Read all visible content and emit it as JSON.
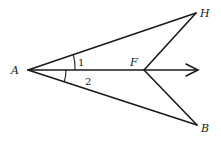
{
  "diagram": {
    "points": {
      "A": {
        "label": "A",
        "x": 28,
        "y": 70
      },
      "H": {
        "label": "H",
        "x": 196,
        "y": 13
      },
      "B": {
        "label": "B",
        "x": 197,
        "y": 125
      },
      "F": {
        "label": "F",
        "x": 144,
        "y": 70
      }
    },
    "ray": {
      "from": "A",
      "through": "F",
      "tip_x": 198,
      "tip_y": 70
    },
    "angles": [
      {
        "label": "1",
        "between": [
          "AH",
          "AF"
        ]
      },
      {
        "label": "2",
        "between": [
          "AF",
          "AB"
        ]
      }
    ],
    "colors": {
      "stroke": "#1a1a1a",
      "background": "#ffffff"
    }
  }
}
